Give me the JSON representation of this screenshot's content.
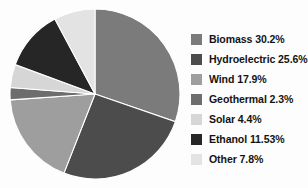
{
  "chart_data": {
    "type": "pie",
    "title": "",
    "subtitle": "",
    "xlabel": "",
    "ylabel": "",
    "grid": false,
    "legend_position": "right",
    "start_angle_deg": 0,
    "direction": "clockwise",
    "categories": [
      "Biomass",
      "Hydroelectric",
      "Wind",
      "Geothermal",
      "Solar",
      "Ethanol",
      "Other"
    ],
    "values": [
      30.2,
      25.6,
      17.9,
      2.3,
      4.4,
      11.53,
      7.8
    ],
    "value_suffix": "%",
    "colors": [
      "#7b7b7b",
      "#4c4c4c",
      "#9e9e9e",
      "#6d6d6d",
      "#d6d6d6",
      "#262626",
      "#e3e3e3"
    ],
    "slices": [
      {
        "label": "Biomass",
        "value": 30.2,
        "display": "30.2%",
        "color": "#7b7b7b"
      },
      {
        "label": "Hydroelectric",
        "value": 25.6,
        "display": "25.6%",
        "color": "#4c4c4c"
      },
      {
        "label": "Wind",
        "value": 17.9,
        "display": "17.9%",
        "color": "#9e9e9e"
      },
      {
        "label": "Geothermal",
        "value": 2.3,
        "display": "2.3%",
        "color": "#6d6d6d"
      },
      {
        "label": "Solar",
        "value": 4.4,
        "display": "4.4%",
        "color": "#d6d6d6"
      },
      {
        "label": "Ethanol",
        "value": 11.53,
        "display": "11.53%",
        "color": "#262626"
      },
      {
        "label": "Other",
        "value": 7.8,
        "display": "7.8%",
        "color": "#e3e3e3"
      }
    ]
  },
  "legend": {
    "items": [
      {
        "text": "Biomass 30.2%",
        "color": "#7b7b7b"
      },
      {
        "text": "Hydroelectric 25.6%",
        "color": "#4c4c4c"
      },
      {
        "text": "Wind 17.9%",
        "color": "#9e9e9e"
      },
      {
        "text": "Geothermal  2.3%",
        "color": "#6d6d6d"
      },
      {
        "text": "Solar 4.4%",
        "color": "#d6d6d6"
      },
      {
        "text": "Ethanol 11.53%",
        "color": "#262626"
      },
      {
        "text": "Other 7.8%",
        "color": "#e3e3e3"
      }
    ]
  },
  "style": {
    "background": "#fdfdfd",
    "text_color": "#141414",
    "slice_edge_color": "#ffffff"
  }
}
